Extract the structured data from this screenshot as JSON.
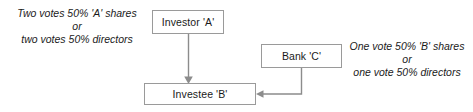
{
  "diagram": {
    "nodes": [
      {
        "id": "investor-a",
        "label": "Investor 'A'"
      },
      {
        "id": "bank-c",
        "label": "Bank 'C'"
      },
      {
        "id": "investee-b",
        "label": "Investee 'B'"
      }
    ],
    "annotations": [
      {
        "id": "investor-a-votes",
        "lines": [
          "Two votes 50% 'A' shares",
          "or",
          "two votes 50% directors"
        ]
      },
      {
        "id": "bank-c-votes",
        "lines": [
          "One vote 50% 'B' shares",
          "or",
          "one vote 50% directors"
        ]
      }
    ],
    "edges": [
      {
        "id": "investor-a-to-investee-b",
        "from": "investor-a",
        "to": "investee-b",
        "arrow": "down"
      },
      {
        "id": "bank-c-to-investee-b",
        "from": "bank-c",
        "to": "investee-b",
        "arrow": "left"
      }
    ],
    "colors": {
      "background": "#ffffff",
      "node_border": "#9a9a9a",
      "node_fill": "#ffffff",
      "edge": "#8c8c8c",
      "text": "#1a1a1a"
    }
  }
}
